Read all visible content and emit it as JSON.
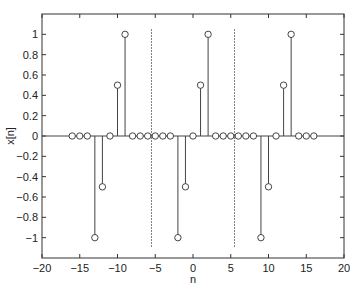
{
  "chart_data": {
    "type": "stem",
    "title": "",
    "xlabel": "n",
    "ylabel": "x[n]",
    "xlim": [
      -20,
      20
    ],
    "ylim": [
      -1.2,
      1.2
    ],
    "xticks": [
      -20,
      -15,
      -10,
      -5,
      0,
      5,
      10,
      15,
      20
    ],
    "xtick_labels": [
      "−20",
      "−15",
      "−10",
      "−5",
      "0",
      "5",
      "10",
      "15",
      "20"
    ],
    "yticks": [
      -1,
      -0.8,
      -0.6,
      -0.4,
      -0.2,
      0,
      0.2,
      0.4,
      0.6,
      0.8,
      1
    ],
    "ytick_labels": [
      "−1",
      "−0.8",
      "−0.6",
      "−0.4",
      "−0.2",
      "0",
      "0.2",
      "0.4",
      "0.6",
      "0.8",
      "1"
    ],
    "grid": false,
    "x": [
      -16,
      -15,
      -14,
      -13,
      -12,
      -11,
      -10,
      -9,
      -8,
      -7,
      -6,
      -5,
      -4,
      -3,
      -2,
      -1,
      0,
      1,
      2,
      3,
      4,
      5,
      6,
      7,
      8,
      9,
      10,
      11,
      12,
      13,
      14,
      15,
      16
    ],
    "values": [
      0,
      0,
      0,
      -1,
      -0.5,
      0,
      0.5,
      1,
      0,
      0,
      0,
      0,
      0,
      0,
      -1,
      -0.5,
      0,
      0.5,
      1,
      0,
      0,
      0,
      0,
      0,
      0,
      -1,
      -0.5,
      0,
      0.5,
      1,
      0,
      0,
      0
    ],
    "annotations": [
      {
        "type": "vline",
        "style": "dotted",
        "x": -5.5,
        "y_range": [
          -1.1,
          1.05
        ]
      },
      {
        "type": "vline",
        "style": "dotted",
        "x": 5.5,
        "y_range": [
          -1.1,
          1.05
        ]
      }
    ],
    "period": 11
  }
}
